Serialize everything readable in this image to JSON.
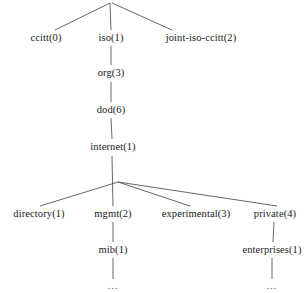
{
  "diagram": {
    "type": "tree",
    "line_color": "#555555",
    "text_color": "#1a1a1a",
    "background": "#ffffff",
    "nodes": [
      {
        "id": "root",
        "label": "",
        "x": 110,
        "y": 2,
        "level": 0
      },
      {
        "id": "ccitt",
        "label": "ccitt(0)",
        "x": 46,
        "y": 38,
        "level": 1
      },
      {
        "id": "iso",
        "label": "iso(1)",
        "x": 111,
        "y": 38,
        "level": 1
      },
      {
        "id": "joint-iso-ccitt",
        "label": "joint-iso-ccitt(2)",
        "x": 201,
        "y": 38,
        "level": 1
      },
      {
        "id": "org",
        "label": "org(3)",
        "x": 111,
        "y": 73,
        "level": 2
      },
      {
        "id": "dod",
        "label": "dod(6)",
        "x": 111,
        "y": 110,
        "level": 3
      },
      {
        "id": "internet",
        "label": "internet(1)",
        "x": 113,
        "y": 147,
        "level": 4
      },
      {
        "id": "directory",
        "label": "directory(1)",
        "x": 39,
        "y": 214,
        "level": 5
      },
      {
        "id": "mgmt",
        "label": "mgmt(2)",
        "x": 113,
        "y": 214,
        "level": 5
      },
      {
        "id": "experimental",
        "label": "experimental(3)",
        "x": 196,
        "y": 214,
        "level": 5
      },
      {
        "id": "private",
        "label": "private(4)",
        "x": 275,
        "y": 214,
        "level": 5
      },
      {
        "id": "mib",
        "label": "mib(1)",
        "x": 113,
        "y": 250,
        "level": 6
      },
      {
        "id": "enterprises",
        "label": "enterprises(1)",
        "x": 272,
        "y": 250,
        "level": 6
      },
      {
        "id": "mib-more",
        "label": "...",
        "x": 113,
        "y": 286,
        "level": 7
      },
      {
        "id": "enterprises-more",
        "label": "...",
        "x": 272,
        "y": 286,
        "level": 7
      }
    ],
    "edges": [
      {
        "from": "root",
        "to": "ccitt",
        "x1": 110,
        "y1": 3,
        "x2": 55,
        "y2": 30
      },
      {
        "from": "root",
        "to": "iso",
        "x1": 110,
        "y1": 3,
        "x2": 111,
        "y2": 30
      },
      {
        "from": "root",
        "to": "joint-iso-ccitt",
        "x1": 112,
        "y1": 3,
        "x2": 172,
        "y2": 30
      },
      {
        "from": "iso",
        "to": "org",
        "x1": 111,
        "y1": 46,
        "x2": 111,
        "y2": 65
      },
      {
        "from": "org",
        "to": "dod",
        "x1": 111,
        "y1": 82,
        "x2": 111,
        "y2": 102
      },
      {
        "from": "dod",
        "to": "internet",
        "x1": 111,
        "y1": 118,
        "x2": 112,
        "y2": 139
      },
      {
        "from": "internet",
        "to": "fan",
        "x1": 112,
        "y1": 156,
        "x2": 113,
        "y2": 206
      },
      {
        "from": "fan",
        "to": "directory",
        "x1": 118,
        "y1": 182,
        "x2": 40,
        "y2": 206
      },
      {
        "from": "fan",
        "to": "experimental",
        "x1": 118,
        "y1": 182,
        "x2": 190,
        "y2": 206
      },
      {
        "from": "fan",
        "to": "private",
        "x1": 118,
        "y1": 182,
        "x2": 277,
        "y2": 206
      },
      {
        "from": "mgmt",
        "to": "mib",
        "x1": 113,
        "y1": 222,
        "x2": 113,
        "y2": 242
      },
      {
        "from": "private",
        "to": "enterprises",
        "x1": 274,
        "y1": 222,
        "x2": 273,
        "y2": 242
      },
      {
        "from": "mib",
        "to": "mib-more",
        "x1": 113,
        "y1": 258,
        "x2": 113,
        "y2": 279
      },
      {
        "from": "enterprises",
        "to": "enterprises-more",
        "x1": 272,
        "y1": 258,
        "x2": 272,
        "y2": 279
      }
    ]
  }
}
